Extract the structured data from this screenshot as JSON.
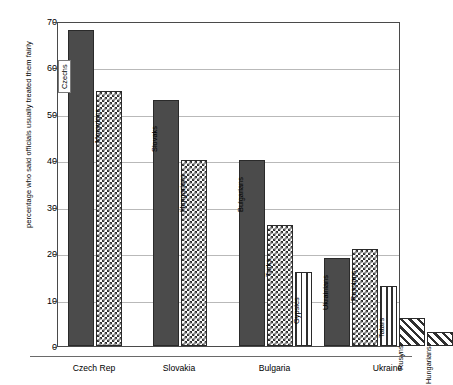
{
  "chart_data": {
    "type": "bar",
    "title": "",
    "xlabel": "",
    "ylabel": "percentage who said officials usually treated them fairly",
    "ylim": [
      0,
      70
    ],
    "yticks": [
      0,
      10,
      20,
      30,
      40,
      50,
      60,
      70
    ],
    "ytick_labels": [
      "0",
      "10",
      "20",
      "30",
      "40",
      "50",
      "60",
      "70"
    ],
    "grid": true,
    "legend": "none",
    "categories": [
      "Czech Rep",
      "Slovakia",
      "Bulgaria",
      "Ukraine"
    ],
    "bars": [
      {
        "group": "Czech Rep",
        "label": "Czechs",
        "value": 68,
        "pattern": "solid",
        "boxed_label": true
      },
      {
        "group": "Czech Rep",
        "label": "Moravians",
        "value": 55,
        "pattern": "check",
        "boxed_label": false
      },
      {
        "group": "Slovakia",
        "label": "Slovaks",
        "value": 53,
        "pattern": "solid",
        "boxed_label": false
      },
      {
        "group": "Slovakia",
        "label": "Hungarians",
        "value": 40,
        "pattern": "check",
        "boxed_label": false
      },
      {
        "group": "Bulgaria",
        "label": "Bulgarians",
        "value": 40,
        "pattern": "solid",
        "boxed_label": false
      },
      {
        "group": "Bulgaria",
        "label": "Turks",
        "value": 26,
        "pattern": "check",
        "boxed_label": false
      },
      {
        "group": "Bulgaria",
        "label": "Gypsies",
        "value": 16,
        "pattern": "vline",
        "boxed_label": false
      },
      {
        "group": "Ukraine",
        "label": "Ukrainians",
        "value": 19,
        "pattern": "solid",
        "boxed_label": false
      },
      {
        "group": "Ukraine",
        "label": "Russians",
        "value": 21,
        "pattern": "check",
        "boxed_label": false
      },
      {
        "group": "Ukraine",
        "label": "Tatars",
        "value": 13,
        "pattern": "vline",
        "boxed_label": false
      },
      {
        "group": "Ukraine",
        "label": "Rusyns",
        "value": 6,
        "pattern": "diag",
        "boxed_label": false
      },
      {
        "group": "Ukraine",
        "label": "Hungarians",
        "value": 3,
        "pattern": "diag",
        "boxed_label": false
      }
    ],
    "colors": {
      "solid_fill": "#4b4b4b",
      "pattern_ink": "#2f2f2f",
      "background": "#ffffff",
      "gridline": "#b9b9b9",
      "frame": "#4a4a4a"
    }
  }
}
